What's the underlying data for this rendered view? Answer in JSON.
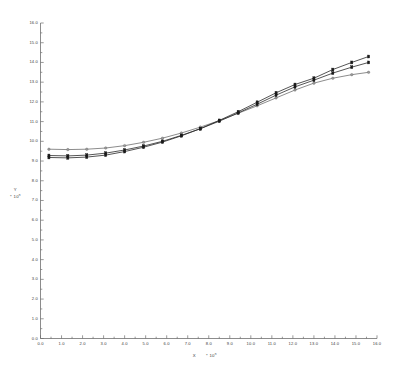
{
  "figure": {
    "background": "#ffffff",
    "axis_color": "#6e6e6e",
    "width": 393,
    "height": 366
  },
  "axes": {
    "x_title_symbol": "X",
    "x_title_mult": "* 10",
    "x_title_exp": "n",
    "y_title_symbol": "Y",
    "y_title_mult": "* 10",
    "y_title_exp": "n"
  },
  "chart_data": {
    "type": "line",
    "title": "",
    "xlabel": "X  * 10^n",
    "ylabel": "Y  * 10^n",
    "xlim": [
      0.0,
      16.0
    ],
    "ylim": [
      0.0,
      16.0
    ],
    "grid": false,
    "legend": "none",
    "xticks": [
      0.0,
      1.0,
      2.0,
      3.0,
      4.0,
      5.0,
      6.0,
      7.0,
      8.0,
      9.0,
      10.0,
      11.0,
      12.0,
      13.0,
      14.0,
      15.0,
      16.0
    ],
    "xticklabels": [
      "0.0",
      "1.0",
      "2.0",
      "3.0",
      "4.0",
      "5.0",
      "6.0",
      "7.0",
      "8.0",
      "9.0",
      "10.0",
      "11.0",
      "12.0",
      "13.0",
      "14.0",
      "15.0",
      "16.0"
    ],
    "yticks": [
      0.0,
      1.0,
      2.0,
      3.0,
      4.0,
      5.0,
      6.0,
      7.0,
      8.0,
      9.0,
      10.0,
      11.0,
      12.0,
      13.0,
      14.0,
      15.0,
      16.0
    ],
    "yticklabels": [
      "0.0",
      "1.0",
      "2.0",
      "3.0",
      "4.0",
      "5.0",
      "6.0",
      "7.0",
      "8.0",
      "9.0",
      "10.0",
      "11.0",
      "12.0",
      "13.0",
      "14.0",
      "15.0",
      "16.0"
    ],
    "x": [
      0.4,
      1.3,
      2.2,
      3.1,
      4.0,
      4.9,
      5.8,
      6.7,
      7.6,
      8.5,
      9.4,
      10.3,
      11.2,
      12.1,
      13.0,
      13.9,
      14.8,
      15.6
    ],
    "series": [
      {
        "name": "series-1",
        "marker": "open-circle",
        "color": "#6a6a6a",
        "values": [
          9.6,
          9.58,
          9.6,
          9.66,
          9.78,
          9.95,
          10.16,
          10.42,
          10.72,
          11.05,
          11.42,
          11.8,
          12.2,
          12.6,
          12.95,
          13.2,
          13.38,
          13.5
        ]
      },
      {
        "name": "series-2",
        "marker": "filled-square",
        "color": "#2a2a2a",
        "values": [
          9.28,
          9.26,
          9.3,
          9.4,
          9.56,
          9.76,
          10.0,
          10.3,
          10.64,
          11.02,
          11.44,
          11.88,
          12.34,
          12.76,
          13.1,
          13.46,
          13.76,
          14.0
        ]
      },
      {
        "name": "series-3",
        "marker": "filled-square",
        "color": "#1a1a1a",
        "values": [
          9.18,
          9.16,
          9.2,
          9.3,
          9.48,
          9.7,
          9.96,
          10.28,
          10.64,
          11.06,
          11.5,
          11.98,
          12.46,
          12.88,
          13.2,
          13.64,
          14.0,
          14.3
        ]
      }
    ]
  }
}
